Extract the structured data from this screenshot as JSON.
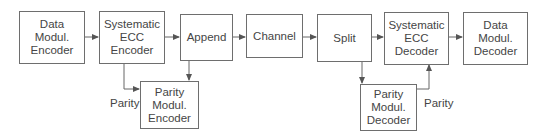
{
  "diagram": {
    "blocks": [
      {
        "id": "data_mod_enc",
        "label": "Data\nModul.\nEncoder"
      },
      {
        "id": "sys_ecc_enc",
        "label": "Systematic\nECC\nEncoder"
      },
      {
        "id": "append",
        "label": "Append"
      },
      {
        "id": "channel",
        "label": "Channel"
      },
      {
        "id": "split",
        "label": "Split"
      },
      {
        "id": "sys_ecc_dec",
        "label": "Systematic\nECC\nDecoder"
      },
      {
        "id": "data_mod_dec",
        "label": "Data\nModul.\nDecoder"
      },
      {
        "id": "parity_mod_enc",
        "label": "Parity\nModul.\nEncoder"
      },
      {
        "id": "parity_mod_dec",
        "label": "Parity\nModul.\nDecoder"
      }
    ],
    "labels": {
      "parity_enc": "Parity",
      "parity_dec": "Parity"
    },
    "edges": [
      [
        "data_mod_enc",
        "sys_ecc_enc"
      ],
      [
        "sys_ecc_enc",
        "append"
      ],
      [
        "sys_ecc_enc",
        "parity_mod_enc"
      ],
      [
        "parity_mod_enc",
        "append"
      ],
      [
        "append",
        "channel"
      ],
      [
        "channel",
        "split"
      ],
      [
        "split",
        "sys_ecc_dec"
      ],
      [
        "split",
        "parity_mod_dec"
      ],
      [
        "parity_mod_dec",
        "sys_ecc_dec"
      ],
      [
        "sys_ecc_dec",
        "data_mod_dec"
      ]
    ]
  }
}
